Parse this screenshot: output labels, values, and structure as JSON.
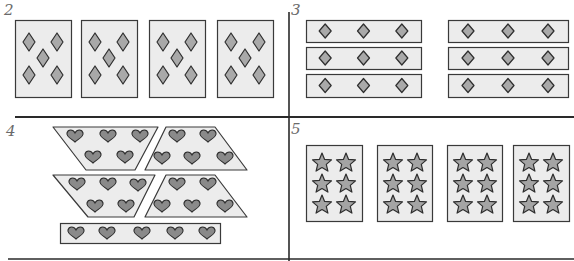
{
  "colors": {
    "background": "#ffffff",
    "card_fill": "#ececec",
    "card_stroke": "#3a3a3a",
    "diamond_fill": "#a9a9a9",
    "heart_fill": "#8a8a8a",
    "star_fill": "#a4a4a4",
    "shape_stroke": "#2e2e2e",
    "divider": "#2a2a2a",
    "number": "#6a6a6a"
  },
  "panels": [
    {
      "number": "2",
      "label_pos": [
        4,
        3
      ],
      "description": "4 cards each with 5 diamonds",
      "cards": [
        {
          "x": 15,
          "y": 20,
          "w": 56,
          "h": 77
        },
        {
          "x": 81,
          "y": 20,
          "w": 56,
          "h": 77
        },
        {
          "x": 149,
          "y": 20,
          "w": 56,
          "h": 77
        },
        {
          "x": 217,
          "y": 20,
          "w": 56,
          "h": 77
        }
      ]
    },
    {
      "number": "3",
      "label_pos": [
        291,
        3
      ],
      "description": "2 groups of 3 strips with 3 diamonds each",
      "strips": [
        {
          "x": 306,
          "y": 20,
          "w": 115,
          "h": 22
        },
        {
          "x": 306,
          "y": 47,
          "w": 115,
          "h": 22
        },
        {
          "x": 306,
          "y": 74,
          "w": 115,
          "h": 23
        },
        {
          "x": 448,
          "y": 20,
          "w": 120,
          "h": 22
        },
        {
          "x": 448,
          "y": 47,
          "w": 120,
          "h": 22
        },
        {
          "x": 448,
          "y": 74,
          "w": 120,
          "h": 23
        }
      ]
    },
    {
      "number": "4",
      "label_pos": [
        6,
        124
      ],
      "description": "4 trapezoids with 5 hearts each and a strip with 5 hearts",
      "trapezoids": [
        {
          "points": "53,127 158,127 135,170 86,170",
          "hearts": [
            [
              75,
              136
            ],
            [
              108,
              136
            ],
            [
              140,
              136
            ],
            [
              93,
              157
            ],
            [
              125,
              157
            ]
          ]
        },
        {
          "points": "166,127 215,127 247,170 145,170",
          "hearts": [
            [
              177,
              136
            ],
            [
              208,
              136
            ],
            [
              162,
              158
            ],
            [
              192,
              158
            ],
            [
              225,
              158
            ]
          ]
        },
        {
          "points": "53,175 155,175 134,217 88,217",
          "hearts": [
            [
              77,
              184
            ],
            [
              108,
              184
            ],
            [
              138,
              185
            ],
            [
              95,
              206
            ],
            [
              126,
              206
            ]
          ]
        },
        {
          "points": "166,175 215,175 247,217 145,217",
          "hearts": [
            [
              177,
              184
            ],
            [
              208,
              184
            ],
            [
              162,
              206
            ],
            [
              192,
              206
            ],
            [
              225,
              206
            ]
          ]
        }
      ],
      "strip": {
        "x": 60,
        "y": 223,
        "w": 160,
        "h": 20,
        "hearts": [
          [
            76,
            233
          ],
          [
            107,
            233
          ],
          [
            142,
            233
          ],
          [
            175,
            233
          ],
          [
            207,
            233
          ]
        ]
      }
    },
    {
      "number": "5",
      "label_pos": [
        291,
        122
      ],
      "description": "4 cards each with 6 stars",
      "cards": [
        {
          "x": 306,
          "y": 145,
          "w": 56,
          "h": 76
        },
        {
          "x": 377,
          "y": 145,
          "w": 55,
          "h": 76
        },
        {
          "x": 447,
          "y": 145,
          "w": 55,
          "h": 76
        },
        {
          "x": 513,
          "y": 145,
          "w": 56,
          "h": 76
        }
      ]
    }
  ],
  "dividers": {
    "vertical_x": 289,
    "horizontal_top_y": 117,
    "horizontal_bottom_y": 259
  }
}
